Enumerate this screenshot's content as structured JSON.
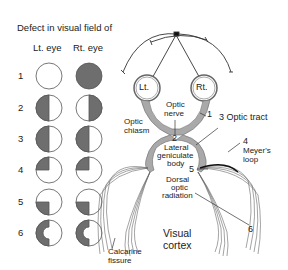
{
  "title": "Defect in visual field of",
  "columns": {
    "left": "Lt. eye",
    "right": "Rt. eye"
  },
  "rows": [
    {
      "num": "1",
      "left_defect": "none",
      "right_defect": "full"
    },
    {
      "num": "2",
      "left_defect": "left-half",
      "right_defect": "right-half"
    },
    {
      "num": "3",
      "left_defect": "left-half",
      "right_defect": "left-half"
    },
    {
      "num": "4",
      "left_defect": "upper-left-quadrant",
      "right_defect": "upper-left-quadrant"
    },
    {
      "num": "5",
      "left_defect": "lower-left-quadrant",
      "right_defect": "lower-left-quadrant"
    },
    {
      "num": "6",
      "left_defect": "left-half-macular-sparing",
      "right_defect": "left-half-macular-sparing"
    }
  ],
  "labels": {
    "left_eye": "Lt.",
    "right_eye": "Rt.",
    "optic_nerve_1": "Optic",
    "optic_nerve_2": "nerve",
    "optic_chiasm_1": "Optic",
    "optic_chiasm_2": "chiasm",
    "num_1": "1",
    "num_2": "2",
    "optic_tract": "3 Optic tract",
    "lgb_1": "Lateral",
    "lgb_2": "geniculate",
    "lgb_3": "body",
    "num_4": "4",
    "meyers_1": "Meyer's",
    "meyers_2": "loop",
    "num_5": "5",
    "dorsal_1": "Dorsal",
    "dorsal_2": "optic",
    "dorsal_3": "radiation",
    "num_6": "6",
    "visual_cortex_1": "Visual",
    "visual_cortex_2": "cortex",
    "calcarine_1": "Calcarine",
    "calcarine_2": "fissure"
  },
  "colors": {
    "defect_fill": "#6e6e6e",
    "pathway_fill": "#a9a9a9",
    "line": "#333333"
  }
}
